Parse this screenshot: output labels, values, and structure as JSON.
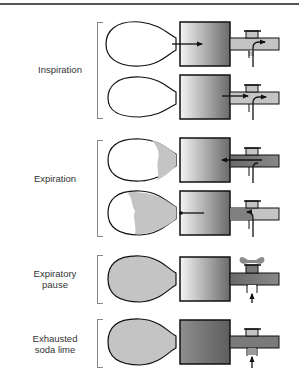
{
  "figure": {
    "panels": [
      {
        "id": "inspiration",
        "label": [
          "Inspiration"
        ],
        "bag_fill": "none",
        "canister": "fresh",
        "flow": "bag-to-patient"
      },
      {
        "id": "expiration",
        "label": [
          "Expiration"
        ],
        "bag_fill": "partial",
        "canister": "fresh",
        "flow": "patient-to-bag"
      },
      {
        "id": "expiratory-pause",
        "label": [
          "Expiratory",
          "pause"
        ],
        "bag_fill": "full",
        "canister": "fresh",
        "flow": "fresh-gas-in, valve-venting"
      },
      {
        "id": "exhausted-soda-lime",
        "label": [
          "Exhausted",
          "soda lime"
        ],
        "bag_fill": "full",
        "canister": "exhausted",
        "flow": "fresh-gas-in"
      }
    ],
    "colors": {
      "outline": "#111111",
      "gas_fill": "#c4c4c4",
      "exhaled_gas": "#8a8a8a",
      "canister_light": "#f2f2f2",
      "canister_dark": "#6e6e6e",
      "canister_exhausted": "#7a7a7a"
    }
  }
}
